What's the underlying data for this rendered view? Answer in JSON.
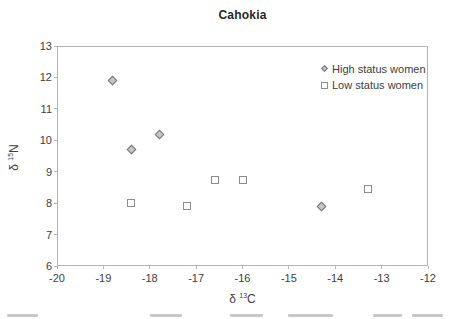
{
  "figure": {
    "title": "Cahokia",
    "legend": [
      {
        "label": "High status women",
        "marker": "diamond"
      },
      {
        "label": "Low status women",
        "marker": "square"
      }
    ],
    "y_axis": {
      "delta": "δ",
      "sup": "15",
      "main": "N"
    },
    "x_axis": {
      "delta": "δ",
      "sup": "13",
      "main": "C"
    },
    "colors": {
      "diamond_fill": "#c6c6c6",
      "diamond_border": "#757575",
      "square_fill": "#ffffff",
      "square_border": "#8c8c8c",
      "axis_line": "#b3b3b3",
      "text": "#3d3d3d"
    }
  },
  "chart_data": {
    "type": "scatter",
    "title": "Cahokia",
    "xlabel": "δ 13C",
    "ylabel": "δ 15N",
    "xlim": [
      -20,
      -12
    ],
    "ylim": [
      6,
      13
    ],
    "xticks": [
      -20,
      -19,
      -18,
      -17,
      -16,
      -15,
      -14,
      -13,
      -12
    ],
    "yticks": [
      6,
      7,
      8,
      9,
      10,
      11,
      12,
      13
    ],
    "grid": false,
    "legend_position": "top-right-inside",
    "series": [
      {
        "name": "High status women",
        "marker": "diamond",
        "points": [
          [
            -18.8,
            11.9
          ],
          [
            -18.4,
            9.7
          ],
          [
            -17.8,
            10.2
          ],
          [
            -14.3,
            7.9
          ]
        ]
      },
      {
        "name": "Low status women",
        "marker": "square",
        "points": [
          [
            -18.4,
            8.0
          ],
          [
            -17.2,
            7.9
          ],
          [
            -16.6,
            8.75
          ],
          [
            -16.0,
            8.75
          ],
          [
            -13.3,
            8.45
          ]
        ]
      }
    ]
  },
  "cropped_caption": {
    "note": "illegible caption line cut off at bottom edge of image",
    "fragments": [
      {
        "x": 7,
        "w": 31
      },
      {
        "x": 150,
        "w": 32
      },
      {
        "x": 230,
        "w": 33
      },
      {
        "x": 288,
        "w": 45
      },
      {
        "x": 373,
        "w": 29
      },
      {
        "x": 412,
        "w": 31
      }
    ]
  }
}
